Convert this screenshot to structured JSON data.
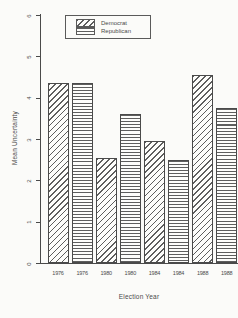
{
  "canvas": {
    "background": "#fbfbf9",
    "ink": "#4a4a4a",
    "hatch_color": "#5e5e5e"
  },
  "chart_data": {
    "type": "bar",
    "title": "",
    "xlabel": "Election Year",
    "ylabel": "Mean Uncertainty",
    "ylim": [
      0,
      6
    ],
    "yticks": [
      0,
      1,
      2,
      3,
      4,
      5,
      6
    ],
    "grid": false,
    "categories": [
      "1976",
      "1980",
      "1984",
      "1988"
    ],
    "x_tick_labels": [
      "1976",
      "1976",
      "1980",
      "1980",
      "1984",
      "1984",
      "1988",
      "1988"
    ],
    "series": [
      {
        "name": "Democrat",
        "pattern": "diagonal-hatch",
        "values": [
          4.35,
          2.55,
          2.95,
          4.55
        ]
      },
      {
        "name": "Republican",
        "pattern": "horizontal-lines",
        "values": [
          4.35,
          3.6,
          2.5,
          3.75
        ]
      }
    ],
    "legend": {
      "position": "top-inside",
      "entries": [
        {
          "label": "Democrat",
          "pattern": "diagonal-hatch"
        },
        {
          "label": "Republican",
          "pattern": "horizontal-lines"
        }
      ]
    }
  }
}
